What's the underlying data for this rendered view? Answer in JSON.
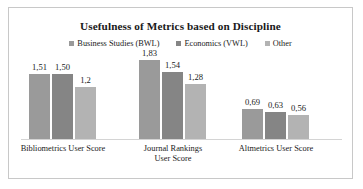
{
  "chart_data": {
    "type": "bar",
    "title": "Usefulness of Metrics based on Discipline",
    "xlabel": "",
    "ylabel": "",
    "grid": false,
    "legend_position": "top-center",
    "decimal_separator": ",",
    "ylim": [
      0,
      2.0
    ],
    "categories": [
      "Bibliometrics User Score",
      "Journal Rankings User Score",
      "Altmetrics User Score"
    ],
    "series": [
      {
        "name": "Business Studies (BWL)",
        "color": "#9a9a9a",
        "values": [
          1.51,
          1.83,
          0.69
        ],
        "labels": [
          "1,51",
          "1,83",
          "0,69"
        ]
      },
      {
        "name": "Economics (VWL)",
        "color": "#858585",
        "values": [
          1.5,
          1.54,
          0.63
        ],
        "labels": [
          "1,50",
          "1,54",
          "0,63"
        ]
      },
      {
        "name": "Other",
        "color": "#b3b3b3",
        "values": [
          1.2,
          1.28,
          0.56
        ],
        "labels": [
          "1,2",
          "1,28",
          "0,56"
        ]
      }
    ]
  },
  "frame": {
    "border_color": "#c8c8c8",
    "background": "#ffffff"
  }
}
